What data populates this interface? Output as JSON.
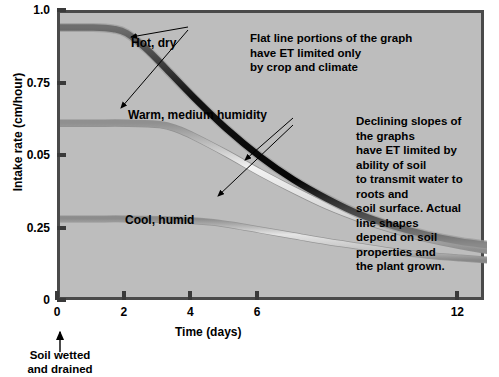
{
  "chart_data": {
    "type": "line",
    "title": "",
    "xlabel": "Time (days)",
    "ylabel": "Intake rate (cm/hour)",
    "xlim": [
      0,
      12.8
    ],
    "ylim": [
      0,
      1.0
    ],
    "xticks": [
      0,
      2,
      4,
      6,
      12
    ],
    "xtick_labels": [
      "0",
      "2",
      "4",
      "6",
      "12"
    ],
    "yticks": [
      0,
      0.25,
      0.5,
      0.75,
      1.0
    ],
    "ytick_labels": [
      "0",
      "0.25",
      "0.05",
      "0.75",
      "1.0"
    ],
    "grid": false,
    "legend_position": "inline-labels",
    "background_color": "#bdbdbd",
    "series": [
      {
        "name": "Hot, dry",
        "color": "#121212",
        "plateau_value": 0.95,
        "breakpoint_day": 2.0,
        "x": [
          0,
          1.0,
          1.6,
          2.0,
          2.6,
          3.2,
          4.0,
          5.0,
          6.0,
          7.0,
          8.0,
          9.0,
          10.0,
          11.0,
          12.0,
          12.8
        ],
        "y": [
          0.95,
          0.95,
          0.945,
          0.93,
          0.875,
          0.805,
          0.71,
          0.6,
          0.505,
          0.425,
          0.36,
          0.305,
          0.265,
          0.235,
          0.212,
          0.2
        ]
      },
      {
        "name": "Warm, medium humidity",
        "color": "#e8e8e8",
        "plateau_value": 0.62,
        "breakpoint_day": 3.5,
        "x": [
          0,
          1.0,
          2.0,
          3.0,
          3.5,
          4.0,
          5.0,
          6.0,
          7.0,
          8.0,
          9.0,
          10.0,
          11.0,
          12.0,
          12.8
        ],
        "y": [
          0.62,
          0.62,
          0.62,
          0.615,
          0.6,
          0.575,
          0.515,
          0.45,
          0.39,
          0.335,
          0.29,
          0.252,
          0.222,
          0.198,
          0.182
        ]
      },
      {
        "name": "Cool, humid",
        "color": "#cfcfcf",
        "plateau_value": 0.29,
        "breakpoint_day": 4.6,
        "x": [
          0,
          1.0,
          2.0,
          3.0,
          4.0,
          4.6,
          5.2,
          6.0,
          7.0,
          8.0,
          9.0,
          10.0,
          11.0,
          12.0,
          12.8
        ],
        "y": [
          0.29,
          0.29,
          0.29,
          0.288,
          0.284,
          0.278,
          0.268,
          0.252,
          0.232,
          0.212,
          0.195,
          0.178,
          0.165,
          0.155,
          0.148
        ]
      }
    ],
    "annotations": [
      {
        "name": "flat-line-note",
        "text": "Flat line portions of the graph\nhave ET limited only\nby crop and climate"
      },
      {
        "name": "declining-slopes-note",
        "text": "Declining slopes of the graphs\nhave ET limited by ability of soil\nto transmit water to roots and\nsoil surface. Actual line shapes\ndepend on soil properties and\nthe plant grown."
      },
      {
        "name": "soil-wetted-note",
        "text": "Soil wetted\nand drained"
      }
    ]
  }
}
